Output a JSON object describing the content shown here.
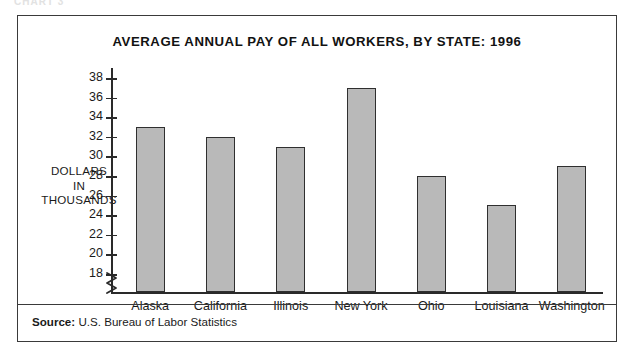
{
  "page": {
    "cropped_header": "CHART 3"
  },
  "figure": {
    "title": "AVERAGE ANNUAL PAY OF ALL WORKERS, BY STATE: 1996",
    "source_label": "Source:",
    "source_text": "U.S. Bureau of Labor Statistics",
    "axis_label_line1": "DOLLARS",
    "axis_label_line2": "IN",
    "axis_label_line3": "THOUSANDS",
    "bar_fill_color": "#b9b9b9",
    "bar_border_color": "#2f2f2f",
    "frame_color": "#3a3a3a"
  },
  "chart_data": {
    "type": "bar",
    "title": "AVERAGE ANNUAL PAY OF ALL WORKERS, BY STATE: 1996",
    "xlabel": "",
    "ylabel": "DOLLARS IN THOUSANDS",
    "categories": [
      "Alaska",
      "California",
      "Illinois",
      "New York",
      "Ohio",
      "Louisiana",
      "Washington"
    ],
    "values": [
      33,
      32,
      31,
      37,
      28,
      25,
      29
    ],
    "ylim": [
      18,
      38
    ],
    "ytick_step": 2,
    "yticks": [
      38,
      36,
      34,
      32,
      30,
      28,
      26,
      24,
      22,
      20,
      18
    ],
    "axis_break": true,
    "grid": false,
    "legend": "none",
    "units": "thousands of dollars",
    "source": "U.S. Bureau of Labor Statistics"
  }
}
